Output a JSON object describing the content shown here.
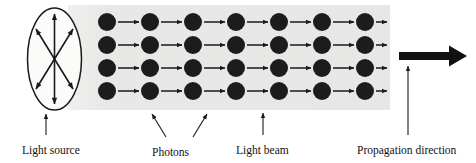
{
  "figure": {
    "background_color": "#ffffff",
    "beam_band_color": "#e8e8e6",
    "photon_color": "#1c1c1c",
    "line_color": "#1a1a1a"
  },
  "labels": {
    "light_source": "Light source",
    "photons": "Photons",
    "light_beam": "Light beam",
    "propagation_direction": "Propagation direction"
  },
  "light_source": {
    "name": "light-source-ellipse",
    "center_x": 54.5,
    "center_y": 59,
    "radius_x": 27,
    "radius_y": 51,
    "ray_count": 6,
    "ray_description": "six double-headed arrows radiating from the centre"
  },
  "beam": {
    "band_x": 68,
    "band_y": 5,
    "band_width": 322,
    "band_height": 105,
    "rows": 4,
    "columns": 7,
    "photon_radius": 8.5,
    "row_centers_y": [
      22,
      45,
      68,
      91
    ],
    "column_centers_x": [
      107,
      150,
      193,
      236,
      279,
      322,
      365
    ]
  },
  "propagation_arrow": {
    "name": "propagation-arrow",
    "x_start": 399,
    "x_end": 467,
    "y": 56,
    "shaft_thickness": 8
  },
  "leaders": [
    {
      "name": "light-source-leader",
      "x1": 46,
      "y1": 135,
      "x2": 46,
      "y2": 113
    },
    {
      "name": "photons-leader-left",
      "x1": 166,
      "y1": 137,
      "x2": 152,
      "y2": 113
    },
    {
      "name": "photons-leader-right",
      "x1": 193,
      "y1": 137,
      "x2": 207,
      "y2": 113
    },
    {
      "name": "light-beam-leader",
      "x1": 263,
      "y1": 135,
      "x2": 263,
      "y2": 112
    },
    {
      "name": "propagation-leader",
      "x1": 408,
      "y1": 135,
      "x2": 408,
      "y2": 68
    }
  ],
  "caption_positions": {
    "light_source_x": 22,
    "light_source_y": 153,
    "photons_x": 152,
    "photons_y": 155,
    "light_beam_x": 238,
    "light_beam_y": 153,
    "propagation_x": 358,
    "propagation_y": 153
  }
}
